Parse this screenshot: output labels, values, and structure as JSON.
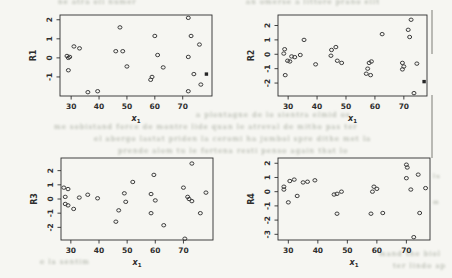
{
  "page": {
    "background": "#f6f6f2",
    "ink_color": "#2e2e2e",
    "point_color": "#3c3c3c"
  },
  "chart_data": [
    {
      "type": "scatter",
      "panel": "top-left",
      "ylabel": "R1",
      "xlabel": "x",
      "xlabel_sub": "1",
      "xticks": [
        30,
        40,
        50,
        60,
        70
      ],
      "yticks": [
        -1,
        0,
        1,
        2
      ],
      "xlim": [
        26,
        80.5
      ],
      "ylim": [
        -2.0,
        2.25
      ],
      "grid": false,
      "marker": "open-circle",
      "points": [
        [
          28.5,
          0.1
        ],
        [
          29,
          0.0
        ],
        [
          29.5,
          0.05
        ],
        [
          29,
          -0.65
        ],
        [
          31,
          0.6
        ],
        [
          33,
          0.5
        ],
        [
          36,
          -1.8
        ],
        [
          39.5,
          -1.75
        ],
        [
          47.5,
          1.6
        ],
        [
          46,
          0.35
        ],
        [
          48.5,
          0.35
        ],
        [
          50,
          -0.45
        ],
        [
          60,
          1.15
        ],
        [
          61,
          0.15
        ],
        [
          63,
          -0.5
        ],
        [
          58.5,
          -1.15
        ],
        [
          59,
          -1.0
        ],
        [
          72,
          2.1
        ],
        [
          72,
          0.05
        ],
        [
          73,
          1.15
        ],
        [
          76,
          0.7
        ],
        [
          74,
          -0.85
        ],
        [
          76.5,
          -1.4
        ],
        [
          72,
          -1.75
        ]
      ],
      "filled_points": [
        [
          78.5,
          -0.85
        ]
      ]
    },
    {
      "type": "scatter",
      "panel": "top-right",
      "ylabel": "R2",
      "xlabel": "x",
      "xlabel_sub": "1",
      "xticks": [
        30,
        40,
        50,
        60,
        70
      ],
      "yticks": [
        -2,
        -1,
        0,
        1,
        2
      ],
      "xlim": [
        26.5,
        78
      ],
      "ylim": [
        -2.9,
        2.73
      ],
      "grid": false,
      "marker": "open-circle",
      "points": [
        [
          28.8,
          0.35
        ],
        [
          28.5,
          0.05
        ],
        [
          29.8,
          -0.45
        ],
        [
          30.6,
          -0.5
        ],
        [
          31.2,
          -0.15
        ],
        [
          32.3,
          -0.2
        ],
        [
          34.2,
          -0.05
        ],
        [
          29,
          -1.45
        ],
        [
          35.5,
          1.0
        ],
        [
          39.5,
          -0.7
        ],
        [
          44.8,
          -0.1
        ],
        [
          45,
          0.3
        ],
        [
          46.5,
          0.5
        ],
        [
          47,
          -0.45
        ],
        [
          48.5,
          -0.6
        ],
        [
          57,
          -1.35
        ],
        [
          58.5,
          -1.45
        ],
        [
          58,
          -0.6
        ],
        [
          58.8,
          -0.5
        ],
        [
          57.5,
          -1.0
        ],
        [
          62.5,
          1.4
        ],
        [
          69.5,
          -0.6
        ],
        [
          70,
          -0.85
        ],
        [
          69.5,
          -1.05
        ],
        [
          71.5,
          1.7
        ],
        [
          72.5,
          2.4
        ],
        [
          72,
          1.2
        ],
        [
          74.5,
          -0.65
        ],
        [
          73.5,
          -2.7
        ]
      ],
      "filled_points": [
        [
          77,
          -1.9
        ]
      ]
    },
    {
      "type": "scatter",
      "panel": "bottom-left",
      "ylabel": "R3",
      "xlabel": "x",
      "xlabel_sub": "1",
      "xticks": [
        30,
        40,
        50,
        60,
        70
      ],
      "yticks": [
        -2,
        -1,
        0,
        1,
        2
      ],
      "xlim": [
        26.5,
        80.5
      ],
      "ylim": [
        -2.89,
        2.89
      ],
      "grid": false,
      "marker": "open-circle",
      "points": [
        [
          27.5,
          0.8
        ],
        [
          29,
          0.7
        ],
        [
          28,
          0.15
        ],
        [
          28,
          -0.35
        ],
        [
          29,
          -0.45
        ],
        [
          31,
          -0.7
        ],
        [
          33,
          0.1
        ],
        [
          36,
          0.3
        ],
        [
          39.5,
          0.05
        ],
        [
          46,
          -1.6
        ],
        [
          47,
          -0.8
        ],
        [
          49,
          0.4
        ],
        [
          49.5,
          -0.2
        ],
        [
          52,
          1.2
        ],
        [
          59.5,
          1.7
        ],
        [
          58.5,
          0.35
        ],
        [
          60,
          -0.1
        ],
        [
          58.5,
          -1.0
        ],
        [
          63,
          -1.85
        ],
        [
          70,
          0.8
        ],
        [
          71.5,
          0.15
        ],
        [
          72,
          0.0
        ],
        [
          73,
          -0.15
        ],
        [
          73,
          2.5
        ],
        [
          70.5,
          -2.8
        ],
        [
          76,
          -1.0
        ],
        [
          78,
          0.45
        ]
      ],
      "filled_points": []
    },
    {
      "type": "scatter",
      "panel": "bottom-right",
      "ylabel": "R4",
      "xlabel": "x",
      "xlabel_sub": "1",
      "xticks": [
        30,
        40,
        50,
        60,
        70
      ],
      "yticks": [
        -3,
        -2,
        -1,
        0,
        1,
        2
      ],
      "xlim": [
        26.5,
        78
      ],
      "ylim": [
        -3.4,
        2.37
      ],
      "grid": false,
      "marker": "open-circle",
      "points": [
        [
          28.5,
          0.35
        ],
        [
          28.5,
          0.15
        ],
        [
          30.5,
          0.75
        ],
        [
          32,
          0.85
        ],
        [
          33,
          -0.3
        ],
        [
          30,
          -0.75
        ],
        [
          35,
          0.65
        ],
        [
          36.5,
          0.7
        ],
        [
          39,
          0.8
        ],
        [
          45.5,
          -0.2
        ],
        [
          46.5,
          -0.15
        ],
        [
          48,
          0.0
        ],
        [
          46.5,
          -1.55
        ],
        [
          58,
          -1.55
        ],
        [
          62,
          -1.5
        ],
        [
          59,
          0.35
        ],
        [
          60,
          0.2
        ],
        [
          58.5,
          0.0
        ],
        [
          70,
          1.9
        ],
        [
          70.3,
          1.7
        ],
        [
          70,
          0.95
        ],
        [
          74,
          1.2
        ],
        [
          71.5,
          0.15
        ],
        [
          76.5,
          0.25
        ],
        [
          74.5,
          -1.5
        ],
        [
          72.5,
          -3.2
        ]
      ],
      "filled_points": []
    }
  ],
  "ghost_text": {
    "lines": [
      {
        "x": 58,
        "y": -2,
        "size": 7,
        "text": "ne atra oli numer"
      },
      {
        "x": 246,
        "y": -2,
        "size": 7,
        "text": "an omerse a littore prano ellt"
      },
      {
        "x": 196,
        "y": 111,
        "size": 7,
        "text": "a plontagne de lo sientra elmid os"
      },
      {
        "x": 54,
        "y": 123,
        "size": 7,
        "text": "me sobistand force de montre lide quan le atreval de mitho pas ter"
      },
      {
        "x": 94,
        "y": 135,
        "size": 7,
        "text": "el abergo lastat priden la ceromi ha jumbol spre dithe met la"
      },
      {
        "x": 118,
        "y": 147,
        "size": 7,
        "text": "prende alom tu le fortena resti penso again that lo"
      },
      {
        "x": 433,
        "y": 172,
        "size": 6,
        "text": "lu"
      },
      {
        "x": 433,
        "y": 198,
        "size": 6,
        "text": "m"
      },
      {
        "x": 379,
        "y": 250,
        "size": 7,
        "text": "mand the biol"
      },
      {
        "x": 393,
        "y": 262,
        "size": 7,
        "text": "ter lindo ap"
      },
      {
        "x": 40,
        "y": 258,
        "size": 7,
        "text": "e la sentim"
      }
    ],
    "smudges": [
      {
        "x": 431,
        "y": 10,
        "h": 44
      },
      {
        "x": 431,
        "y": 95,
        "h": 63
      }
    ]
  }
}
